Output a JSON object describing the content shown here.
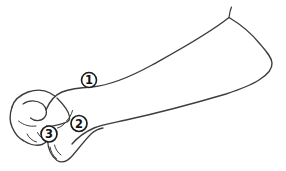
{
  "figure": {
    "callouts": [
      {
        "label": "1"
      },
      {
        "label": "2"
      },
      {
        "label": "3"
      }
    ],
    "colors": {
      "background": "#ffffff",
      "line": "#3d3d3d",
      "callout_ring": "#1c1c1c",
      "callout_fill": "#ffffff",
      "callout_text": "#111111"
    }
  }
}
